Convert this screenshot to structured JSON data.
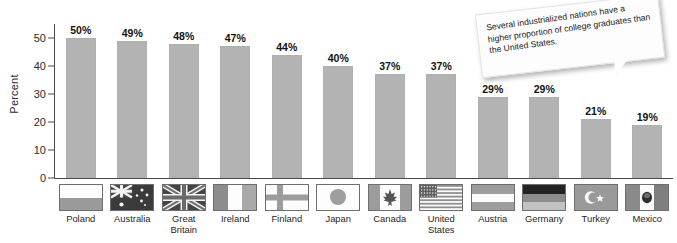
{
  "chart_data": {
    "type": "bar",
    "title": "",
    "xlabel": "",
    "ylabel": "Percent",
    "ylim": [
      0,
      55
    ],
    "yticks": [
      0,
      10,
      20,
      30,
      40,
      50
    ],
    "grid": false,
    "legend": "none",
    "value_suffix": "%",
    "categories": [
      "Poland",
      "Australia",
      "Great\nBritain",
      "Ireland",
      "Finland",
      "Japan",
      "Canada",
      "United\nStates",
      "Austria",
      "Germany",
      "Turkey",
      "Mexico"
    ],
    "values": [
      50,
      49,
      48,
      47,
      44,
      40,
      37,
      37,
      29,
      29,
      21,
      19
    ],
    "data_labels": [
      "50%",
      "49%",
      "48%",
      "47%",
      "44%",
      "40%",
      "37%",
      "37%",
      "29%",
      "29%",
      "21%",
      "19%"
    ],
    "bar_color": "#b3b3b3",
    "axis_color": "#4a4a4a"
  },
  "annotation": {
    "text": "Several industrialized nations have a higher proportion of college graduates than the United States."
  },
  "flags": [
    {
      "country": "Poland",
      "icon": "flag-poland-icon"
    },
    {
      "country": "Australia",
      "icon": "flag-australia-icon"
    },
    {
      "country": "Great Britain",
      "icon": "flag-great-britain-icon"
    },
    {
      "country": "Ireland",
      "icon": "flag-ireland-icon"
    },
    {
      "country": "Finland",
      "icon": "flag-finland-icon"
    },
    {
      "country": "Japan",
      "icon": "flag-japan-icon"
    },
    {
      "country": "Canada",
      "icon": "flag-canada-icon"
    },
    {
      "country": "United States",
      "icon": "flag-united-states-icon"
    },
    {
      "country": "Austria",
      "icon": "flag-austria-icon"
    },
    {
      "country": "Germany",
      "icon": "flag-germany-icon"
    },
    {
      "country": "Turkey",
      "icon": "flag-turkey-icon"
    },
    {
      "country": "Mexico",
      "icon": "flag-mexico-icon"
    }
  ]
}
